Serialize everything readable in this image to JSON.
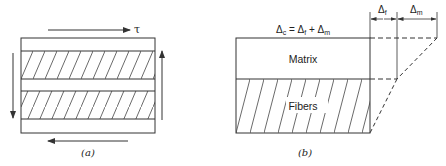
{
  "panel_a": {
    "caption": "(a)",
    "shear_label": "τ"
  },
  "panel_b": {
    "caption": "(b)",
    "equation": {
      "lhs": "Δ",
      "lhs_sub": "c",
      "eq": " = Δ",
      "f_sub": "f",
      "plus": " + Δ",
      "m_sub": "m"
    },
    "matrix_label": "Matrix",
    "fibers_label": "Fibers",
    "delta_f": {
      "sym": "Δ",
      "sub": "f"
    },
    "delta_m": {
      "sym": "Δ",
      "sub": "m"
    }
  },
  "colors": {
    "line": "#333333",
    "background": "#ffffff"
  }
}
